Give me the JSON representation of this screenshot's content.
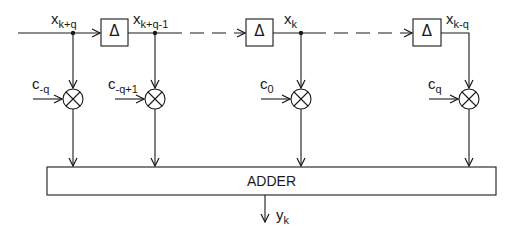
{
  "diagram": {
    "type": "transversal (FIR) filter block diagram",
    "input_label": {
      "base": "x",
      "sub": "k+q"
    },
    "delay_symbol": "Δ",
    "signals": [
      {
        "base": "x",
        "sub": "k+q"
      },
      {
        "base": "x",
        "sub": "k+q-1"
      },
      {
        "base": "x",
        "sub": "k"
      },
      {
        "base": "x",
        "sub": "k-q"
      }
    ],
    "coefficients": [
      {
        "base": "c",
        "sub": "-q"
      },
      {
        "base": "c",
        "sub": "-q+1"
      },
      {
        "base": "c",
        "sub": "0"
      },
      {
        "base": "c",
        "sub": "q"
      }
    ],
    "adder_label": "ADDER",
    "output": {
      "base": "y",
      "sub": "k"
    }
  }
}
